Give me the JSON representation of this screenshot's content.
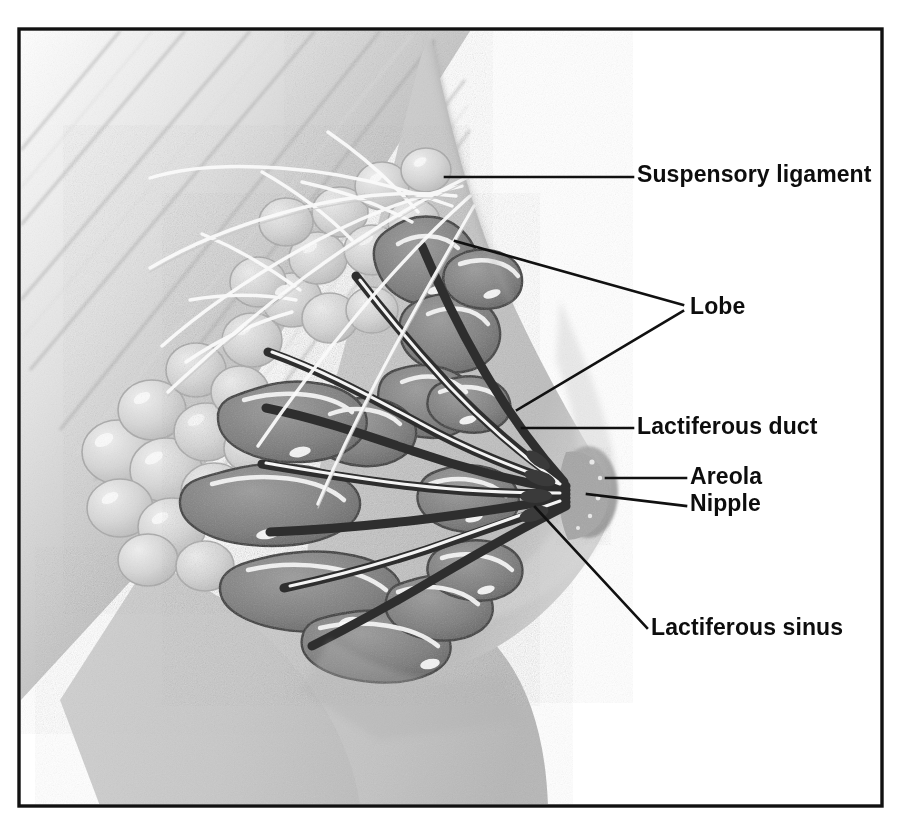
{
  "figure": {
    "background_color": "#ffffff",
    "frame_color": "#111111",
    "label_color": "#0d0d0d",
    "leader_color": "#111111",
    "frame": {
      "x": 19,
      "y": 29,
      "width": 863,
      "height": 777
    }
  },
  "labels": [
    {
      "id": "suspensory-ligament",
      "text": "Suspensory ligament",
      "text_x": 637,
      "text_y": 176,
      "leaders": [
        [
          [
            445,
            177
          ],
          [
            633,
            177
          ]
        ]
      ]
    },
    {
      "id": "lobe",
      "text": "Lobe",
      "text_x": 690,
      "text_y": 308,
      "leaders": [
        [
          [
            455,
            241
          ],
          [
            683,
            305
          ]
        ],
        [
          [
            517,
            410
          ],
          [
            683,
            311
          ]
        ]
      ]
    },
    {
      "id": "lactiferous-duct",
      "text": "Lactiferous duct",
      "text_x": 637,
      "text_y": 428,
      "leaders": [
        [
          [
            522,
            428
          ],
          [
            633,
            428
          ]
        ]
      ]
    },
    {
      "id": "areola",
      "text": "Areola",
      "text_x": 690,
      "text_y": 478,
      "leaders": [
        [
          [
            606,
            478
          ],
          [
            686,
            478
          ]
        ]
      ]
    },
    {
      "id": "nipple",
      "text": "Nipple",
      "text_x": 690,
      "text_y": 505,
      "leaders": [
        [
          [
            587,
            494
          ],
          [
            686,
            506
          ]
        ]
      ]
    },
    {
      "id": "lactiferous-sinus",
      "text": "Lactiferous sinus",
      "text_x": 651,
      "text_y": 629,
      "leaders": [
        [
          [
            535,
            507
          ],
          [
            647,
            628
          ]
        ]
      ]
    }
  ],
  "illustration": {
    "regions": [
      {
        "name": "pectoral-muscle",
        "tone": "#b9b9b9"
      },
      {
        "name": "skin-breast-contour",
        "tone": "#c9c9c9"
      },
      {
        "name": "torso-chest-wall",
        "tone": "#c4c4c4"
      },
      {
        "name": "glandular-lobules",
        "tone": "#dcdcdc"
      },
      {
        "name": "lobe-duct-mass",
        "tone": "#8a8a8a"
      },
      {
        "name": "lactiferous-ducts",
        "tone": "#4a4a4a"
      },
      {
        "name": "nipple",
        "tone": "#9a9a9a"
      },
      {
        "name": "areola",
        "tone": "#b0b0b0"
      },
      {
        "name": "suspensory-ligament-strands",
        "tone": "#f2f2f2"
      }
    ]
  }
}
